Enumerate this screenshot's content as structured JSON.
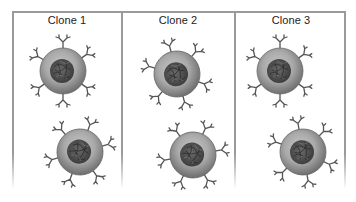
{
  "figure": {
    "panels": [
      {
        "title": "Clone 1",
        "cells": [
          {
            "cx": 63,
            "cy": 71
          },
          {
            "cx": 80,
            "cy": 152
          }
        ]
      },
      {
        "title": "Clone 2",
        "cells": [
          {
            "cx": 177,
            "cy": 74
          },
          {
            "cx": 193,
            "cy": 155
          }
        ]
      },
      {
        "title": "Clone 3",
        "cells": [
          {
            "cx": 280,
            "cy": 71
          },
          {
            "cx": 303,
            "cy": 152
          }
        ]
      }
    ],
    "colors": {
      "frame": "#9a9a9a",
      "cytoplasm_light": "#bdbdbd",
      "cytoplasm_dark": "#7a7a7a",
      "nucleus": "#4a4a4a",
      "antibody": "#555555"
    }
  }
}
